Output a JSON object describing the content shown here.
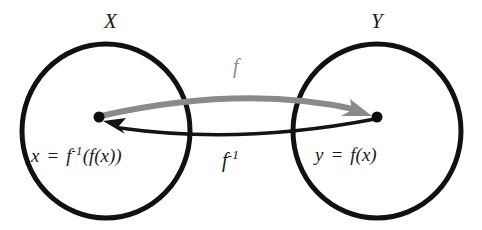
{
  "diagram": {
    "type": "set-mapping-diagram",
    "background_color": "#ffffff",
    "stroke_color": "#111111",
    "accent_gray": "#8a8a8a"
  },
  "sets": [
    {
      "id": "set-x",
      "label": "X",
      "element_label": "x = f ⁻¹( f(x) )",
      "element_label_parts": {
        "variable": "x",
        "equals": "=",
        "function": "f",
        "exponent": "-1",
        "open_paren": "(",
        "inner": "f(x)",
        "close_paren": ")"
      },
      "center": {
        "x": 106,
        "y": 131
      },
      "radius_x": 84,
      "radius_y": 87
    },
    {
      "id": "set-y",
      "label": "Y",
      "element_label": "y = f(x)",
      "element_label_parts": {
        "variable": "y",
        "equals": "=",
        "function": "f",
        "argument": "(x)"
      },
      "center": {
        "x": 377,
        "y": 131
      },
      "radius_x": 84,
      "radius_y": 87
    }
  ],
  "points": [
    {
      "id": "point-x",
      "in_set": "X",
      "x": 99,
      "y": 117
    },
    {
      "id": "point-y",
      "in_set": "Y",
      "x": 377,
      "y": 117
    }
  ],
  "arrows": [
    {
      "id": "arrow-forward",
      "label": "f",
      "label_superscript": "",
      "color": "#8a8a8a",
      "from": "point-x",
      "to": "point-y",
      "direction": "X to Y",
      "curvature": "arcs upward"
    },
    {
      "id": "arrow-inverse",
      "label": "f",
      "label_superscript": "-1",
      "color": "#141414",
      "from": "point-y",
      "to": "point-x",
      "direction": "Y to X",
      "curvature": "arcs downward"
    }
  ]
}
